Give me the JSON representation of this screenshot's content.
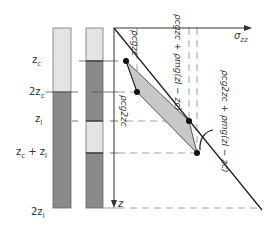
{
  "diagram": {
    "axes": {
      "x_label": "σ",
      "x_label_sub": "zz",
      "y_label": "z"
    },
    "depth_labels": [
      {
        "id": "zc",
        "text": "z",
        "sub": "c",
        "suffix": ""
      },
      {
        "id": "2zc",
        "text": "2z",
        "sub": "c",
        "suffix": ""
      },
      {
        "id": "zl",
        "text": "z",
        "sub": "l",
        "suffix": ""
      },
      {
        "id": "zc_plus_zl",
        "text": "z",
        "sub": "c",
        "suffix": " + z",
        "suffix_sub": "l"
      },
      {
        "id": "2zl",
        "text": "2z",
        "sub": "l",
        "suffix": ""
      }
    ],
    "stress_labels": [
      {
        "id": "rho_c_g_zc",
        "text": "ρcgzc"
      },
      {
        "id": "rho_c_g_2zc",
        "text": "ρcg2zc"
      },
      {
        "id": "rho_c_g_zc_plus",
        "text": "ρcgzc + ρmg(zl − zc)"
      },
      {
        "id": "rho_c_g_2zc_plus",
        "text": "ρcg2zc + ρmg(zl − zc)"
      }
    ],
    "colors": {
      "light_layer": "#e4e4e4",
      "dark_layer": "#8a8a8a",
      "shade": "#c8c8c8",
      "line": "#222222",
      "dash": "#888888"
    }
  }
}
